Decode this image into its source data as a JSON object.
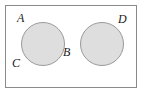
{
  "figure": {
    "type": "venn-diagram",
    "width": 143,
    "height": 95,
    "colors": {
      "background": "#ffffff",
      "rectangle_border": "#8a8a8a",
      "circle_fill": "#dedede",
      "circle_border": "#9a9a9a",
      "label_text": "#1a1a1a"
    },
    "universe": {
      "shape": "rectangle",
      "x": 5,
      "y": 5,
      "width": 132,
      "height": 83
    },
    "circles": [
      {
        "name": "left-circle",
        "cx": 43,
        "cy": 44,
        "r": 22
      },
      {
        "name": "right-circle",
        "cx": 102,
        "cy": 44,
        "r": 22
      }
    ],
    "labels": [
      {
        "id": "A",
        "text": "A",
        "position": "upper-left-of-left-circle",
        "x": 17,
        "y": 12
      },
      {
        "id": "B",
        "text": "B",
        "position": "right-of-left-circle",
        "x": 63,
        "y": 46
      },
      {
        "id": "C",
        "text": "C",
        "position": "lower-left-of-left-circle",
        "x": 12,
        "y": 57
      },
      {
        "id": "D",
        "text": "D",
        "position": "upper-right-of-right-circle",
        "x": 118,
        "y": 13
      }
    ]
  }
}
